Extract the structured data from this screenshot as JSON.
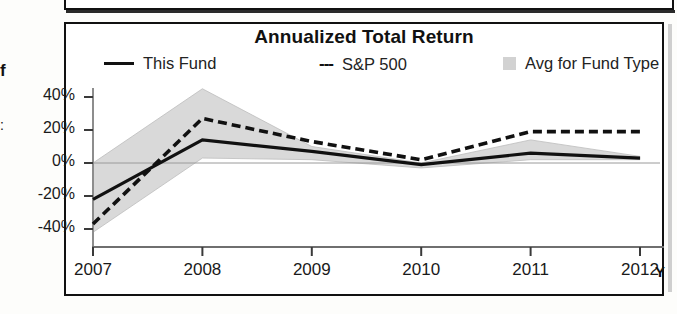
{
  "panel": {
    "title": "Annualized Total Return",
    "bleed_fragments": [
      "f",
      ":"
    ]
  },
  "legend": {
    "items": [
      {
        "label": "This Fund",
        "marker": "solid-line",
        "color": "#111111"
      },
      {
        "label": "S&P 500",
        "marker": "dashed-line",
        "prefix": "---",
        "color": "#111111"
      },
      {
        "label": "Avg for Fund Type",
        "marker": "filled-square",
        "color": "#d2d2d2"
      }
    ]
  },
  "axes": {
    "y_ticks": [
      "40%",
      "20%",
      "0%",
      "-20%",
      "-40%"
    ],
    "x_ticks": [
      "2007",
      "2008",
      "2009",
      "2010",
      "2011",
      "2012"
    ],
    "x_unit": "Y"
  },
  "chart_data": {
    "type": "line",
    "title": "Annualized Total Return",
    "xlabel": "Year",
    "ylabel": "",
    "categories": [
      "2007",
      "2008",
      "2009",
      "2010",
      "2011",
      "2012"
    ],
    "ylim": [
      -50,
      50
    ],
    "yticks": [
      -40,
      -20,
      0,
      20,
      40
    ],
    "ytick_labels": [
      "-40%",
      "-20%",
      "0%",
      "20%",
      "40%"
    ],
    "grid": false,
    "zero_line": true,
    "legend_position": "top",
    "series": [
      {
        "name": "This Fund",
        "style": "solid",
        "color": "#111111",
        "values": [
          -22,
          14,
          7,
          -1,
          6,
          3
        ]
      },
      {
        "name": "S&P 500",
        "style": "dashed",
        "color": "#111111",
        "values": [
          -37,
          27,
          13,
          2,
          19,
          19
        ]
      }
    ],
    "band": {
      "name": "Avg for Fund Type",
      "fill": "#d9d9d9",
      "upper": [
        0,
        45,
        10,
        0,
        14,
        4
      ],
      "lower": [
        -42,
        3,
        2,
        -3,
        2,
        2
      ]
    }
  }
}
